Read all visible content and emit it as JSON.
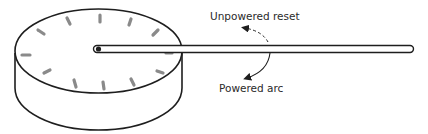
{
  "diagram": {
    "type": "dial-with-needle",
    "labels": {
      "unpowered_reset": "Unpowered reset",
      "powered_arc": "Powered arc"
    },
    "dial": {
      "tick_count": 12,
      "tick_color": "#8a8a8a",
      "outline_color": "#1e1e1e"
    },
    "needle": {
      "color": "#1e1e1e",
      "fill": "#ffffff"
    },
    "arrows": [
      {
        "name": "unpowered-reset-arrow",
        "style": "dashed"
      },
      {
        "name": "powered-arc-arrow",
        "style": "solid"
      }
    ]
  }
}
